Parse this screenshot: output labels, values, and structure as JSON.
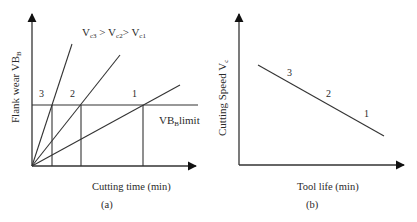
{
  "figure_a": {
    "caption": "(a)",
    "xlabel": "Cutting time (min)",
    "ylabel_main": "Flank wear VB",
    "ylabel_sub": "B",
    "relation": {
      "v3": "V",
      "v3_sub": "c3",
      "gt1": " > ",
      "v2": "V",
      "v2_sub": "c2",
      "gt2": "> ",
      "v1": "V",
      "v1_sub": "c1"
    },
    "limit_label_main": "VB",
    "limit_label_sub": "B",
    "limit_label_suffix": "limit",
    "line_labels": [
      "3",
      "2",
      "1"
    ]
  },
  "figure_b": {
    "caption": "(b)",
    "xlabel": "Tool life (min)",
    "ylabel_main": "Cutting Speed V",
    "ylabel_sub": "c",
    "point_labels": [
      "3",
      "2",
      "1"
    ]
  },
  "colors": {
    "line": "#2a2a2a",
    "text": "#2a2a2a",
    "background": "#ffffff"
  }
}
